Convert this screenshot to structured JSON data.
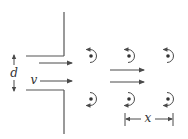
{
  "diagram": {
    "colors": {
      "line": "#4a4a4a",
      "background": "#ffffff"
    },
    "labels": {
      "width": "d",
      "velocity": "v",
      "spacing": "x"
    },
    "walls": {
      "upper": {
        "vertical": [
          64,
          12,
          64,
          56
        ],
        "horizontal": [
          26,
          56,
          64,
          56
        ]
      },
      "lower": {
        "horizontal": [
          26,
          90,
          64,
          90
        ],
        "vertical": [
          64,
          90,
          64,
          134
        ]
      }
    },
    "dimension_d": {
      "x": 14,
      "y1": 55,
      "y2": 91,
      "label_pos": [
        14,
        76
      ]
    },
    "inlet_arrows": [
      {
        "x1": 39,
        "y1": 63,
        "x2": 72,
        "y2": 63
      },
      {
        "x1": 40,
        "y1": 81,
        "x2": 72,
        "y2": 81
      }
    ],
    "velocity_label_pos": [
      34,
      84
    ],
    "flow_arrows": [
      {
        "x1": 110,
        "y1": 70,
        "x2": 144,
        "y2": 70
      },
      {
        "x1": 110,
        "y1": 82,
        "x2": 144,
        "y2": 82
      }
    ],
    "vortices": [
      {
        "row": "top",
        "cx": 92,
        "cy": 56,
        "rotation": "clockwise-open-left-top-arrow"
      },
      {
        "row": "top",
        "cx": 130,
        "cy": 56,
        "rotation": "clockwise-open-left-top-arrow"
      },
      {
        "row": "top",
        "cx": 169,
        "cy": 56,
        "rotation": "clockwise-open-left-top-arrow"
      },
      {
        "row": "bottom",
        "cx": 92,
        "cy": 99,
        "rotation": "counterclockwise-open-left-bottom-arrow"
      },
      {
        "row": "bottom",
        "cx": 130,
        "cy": 99,
        "rotation": "counterclockwise-open-left-bottom-arrow"
      },
      {
        "row": "bottom",
        "cx": 169,
        "cy": 99,
        "rotation": "counterclockwise-open-left-bottom-arrow"
      }
    ],
    "dimension_x": {
      "y": 119,
      "x1": 125,
      "x2": 173,
      "tick_top": 113,
      "tick_bottom": 126,
      "label_pos": [
        148,
        122
      ]
    }
  }
}
